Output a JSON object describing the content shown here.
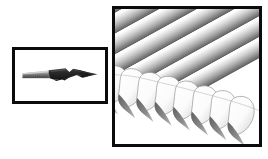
{
  "figure": {
    "type": "scientific-specimen-photo-pair",
    "caption": "",
    "background_color": "#ffffff"
  },
  "inset_panel": {
    "name": "whole-blade-inset",
    "label": "",
    "border_color": "#0b0b0b",
    "border_width_px": 3,
    "background_color": "#ffffff",
    "rect": {
      "x": 12,
      "y": 47,
      "w": 96,
      "h": 57
    },
    "specimen": {
      "description": "side view of a knife blade with serrated heel and dark pointed tip",
      "handle_color": "#8e8e8e",
      "serration_color": "#6d6d6d",
      "blade_color": "#2b2b2b",
      "tip_color": "#1a1a1a",
      "highlight_color": "#c9c9c9"
    }
  },
  "main_panel": {
    "name": "magnified-serration-panel",
    "label": "",
    "border_color": "#0b0b0b",
    "border_width_px": 3,
    "background_color": "#ffffff",
    "rect": {
      "x": 112,
      "y": 6,
      "w": 150,
      "h": 141
    },
    "content": {
      "description": "high magnification view of the serrated cutting edge showing diagonal grinding ridges and a row of rounded teeth with cast shadows",
      "ridge_count": 7,
      "tooth_count": 8,
      "ridge_angle_deg": -30,
      "ridge_light_color": "#ffffff",
      "ridge_mid_color": "#b8b8b8",
      "ridge_dark_color": "#6f6f6f",
      "tooth_fill_color": "#fdfdfd",
      "tooth_outline_color": "#9a9a9a",
      "shadow_color": "#8c8c8c",
      "deep_shadow_color": "#5c5c5c"
    }
  },
  "colors": {
    "frame": "#0b0b0b",
    "page_background": "#ffffff",
    "metal_light": "#f2f2f2",
    "metal_mid": "#b0b0b0",
    "metal_dark": "#5a5a5a"
  }
}
